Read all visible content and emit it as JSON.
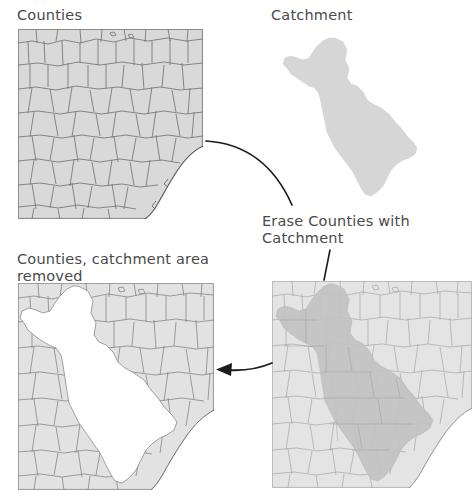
{
  "diagram": {
    "type": "gis-workflow-erase",
    "background_color": "#ffffff",
    "text_color": "#4a4a4a",
    "labels": {
      "counties": "Counties",
      "catchment": "Catchment",
      "erase_operation": "Erase Counties with Catchment",
      "result": "Counties, catchment area removed"
    },
    "panels": [
      {
        "name": "counties-map",
        "title": "Counties",
        "fill_color": "#d9d9d9",
        "line_color": "#6e6e6e",
        "description": "County polygons with coastline at lower right"
      },
      {
        "name": "catchment-map",
        "title": "Catchment",
        "fill_color": "#d6d6d6",
        "line_color": "#d6d6d6",
        "description": "Single elongated north-south watershed polygon"
      },
      {
        "name": "overlay-map",
        "title": "Erase Counties with Catchment",
        "fill_color": "#e2e2e2",
        "overlay_color": "#c2c2c2",
        "line_color": "#9a9a9a",
        "description": "Catchment polygon overlaid on the counties map"
      },
      {
        "name": "result-map",
        "title": "Counties, catchment area removed",
        "fill_color": "#e0e0e0",
        "line_color": "#808080",
        "hole_color": "#ffffff",
        "description": "Counties layer with the catchment area erased leaving a white void"
      }
    ],
    "connectors": [
      {
        "name": "curve-counties-to-erase",
        "style": "curved-line",
        "arrowhead": "none",
        "from": "counties-map",
        "to": "erase-operation-label"
      },
      {
        "name": "line-erase-to-overlay",
        "style": "straight-line",
        "arrowhead": "none",
        "from": "erase-operation-label",
        "to": "overlay-map"
      },
      {
        "name": "arrow-overlay-to-result",
        "style": "arrow",
        "arrowhead": "left",
        "from": "overlay-map",
        "to": "result-map"
      }
    ]
  }
}
